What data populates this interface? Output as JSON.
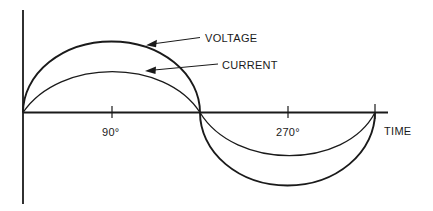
{
  "diagram": {
    "type": "waveform",
    "labels": {
      "voltage": "VOLTAGE",
      "current": "CURRENT",
      "time_axis": "TIME",
      "tick_90": "90°",
      "tick_270": "270°"
    },
    "series": [
      {
        "name": "VOLTAGE",
        "relative_amplitude": 1.0,
        "phase_deg": 0
      },
      {
        "name": "CURRENT",
        "relative_amplitude": 0.6,
        "phase_deg": 0
      }
    ],
    "x_ticks_deg": [
      90,
      270
    ],
    "x_range_deg": [
      0,
      360
    ],
    "colors": {
      "line": "#1a1a1a",
      "background": "#ffffff"
    }
  }
}
